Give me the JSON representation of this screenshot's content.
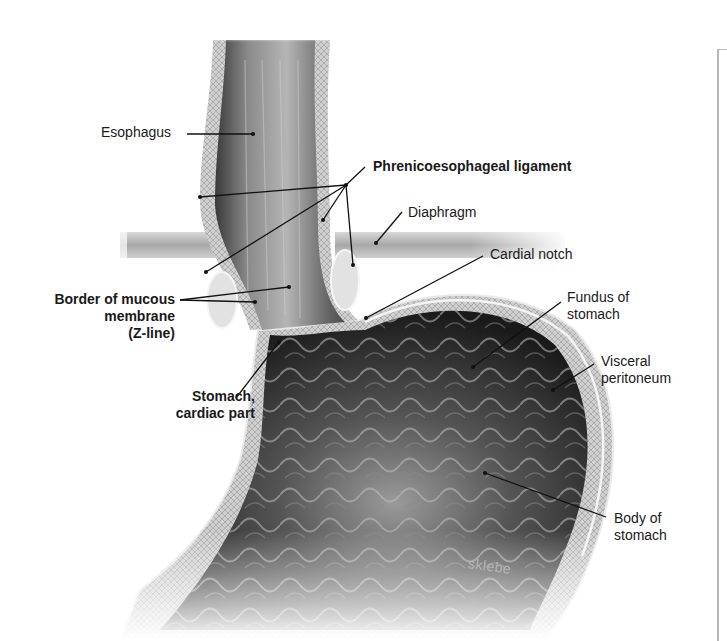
{
  "figure": {
    "signature": "sklebe",
    "frame_color": "#b8b8b8",
    "label_color": "#1a1a1a",
    "leader_color": "#111111"
  },
  "labels": [
    {
      "id": "esophagus",
      "text": "Esophagus",
      "bold": false,
      "x": 101,
      "y": 124,
      "align": "left"
    },
    {
      "id": "phrenicoesophageal-ligament",
      "text": "Phrenicoesophageal ligament",
      "bold": true,
      "x": 373,
      "y": 159,
      "align": "left"
    },
    {
      "id": "diaphragm",
      "text": "Diaphragm",
      "bold": false,
      "x": 408,
      "y": 205,
      "align": "left"
    },
    {
      "id": "cardial-notch",
      "text": "Cardial notch",
      "bold": false,
      "x": 490,
      "y": 247,
      "align": "left"
    },
    {
      "id": "border-mucous-membrane",
      "lines": [
        "Border of mucous",
        "membrane",
        "(Z-line)"
      ],
      "bold": true,
      "x": 10,
      "y": 291,
      "width": 165,
      "align": "right"
    },
    {
      "id": "fundus",
      "lines": [
        "Fundus of",
        "stomach"
      ],
      "bold": false,
      "x": 567,
      "y": 290,
      "align": "left"
    },
    {
      "id": "visceral-peritoneum",
      "lines": [
        "Visceral",
        "peritoneum"
      ],
      "bold": false,
      "x": 601,
      "y": 354,
      "align": "left"
    },
    {
      "id": "stomach-cardiac-part",
      "lines": [
        "Stomach,",
        "cardiac part"
      ],
      "bold": true,
      "x": 140,
      "y": 388,
      "width": 115,
      "align": "right"
    },
    {
      "id": "body-of-stomach",
      "lines": [
        "Body of",
        "stomach"
      ],
      "bold": false,
      "x": 614,
      "y": 511,
      "align": "left"
    }
  ],
  "leaders": [
    {
      "for": "esophagus",
      "points": [
        [
          187,
          134
        ],
        [
          253,
          134
        ]
      ]
    },
    {
      "for": "phrenicoesophageal-ligament",
      "points": [
        [
          365,
          167
        ],
        [
          346,
          185
        ]
      ]
    },
    {
      "for": "phrenicoesophageal-ligament",
      "points": [
        [
          346,
          185
        ],
        [
          200,
          197
        ]
      ]
    },
    {
      "for": "phrenicoesophageal-ligament",
      "points": [
        [
          346,
          185
        ],
        [
          206,
          272
        ]
      ]
    },
    {
      "for": "phrenicoesophageal-ligament",
      "points": [
        [
          346,
          185
        ],
        [
          323,
          220
        ]
      ]
    },
    {
      "for": "phrenicoesophageal-ligament",
      "points": [
        [
          346,
          185
        ],
        [
          353,
          265
        ]
      ]
    },
    {
      "for": "diaphragm",
      "points": [
        [
          402,
          212
        ],
        [
          376,
          243
        ]
      ]
    },
    {
      "for": "cardial-notch",
      "points": [
        [
          483,
          256
        ],
        [
          366,
          318
        ]
      ]
    },
    {
      "for": "border-mucous-membrane",
      "points": [
        [
          180,
          300
        ],
        [
          289,
          287
        ]
      ]
    },
    {
      "for": "border-mucous-membrane",
      "points": [
        [
          180,
          300
        ],
        [
          255,
          302
        ]
      ]
    },
    {
      "for": "fundus",
      "points": [
        [
          561,
          302
        ],
        [
          473,
          367
        ]
      ]
    },
    {
      "for": "visceral-peritoneum",
      "points": [
        [
          594,
          364
        ],
        [
          553,
          390
        ]
      ]
    },
    {
      "for": "stomach-cardiac-part",
      "points": [
        [
          236,
          398
        ],
        [
          279,
          342
        ]
      ]
    },
    {
      "for": "body-of-stomach",
      "points": [
        [
          606,
          517
        ],
        [
          485,
          473
        ]
      ]
    }
  ]
}
